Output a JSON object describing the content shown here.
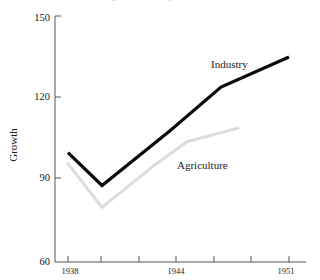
{
  "figure": {
    "clipped_title": "Growth of industrial and agricultural output, 1938-1951",
    "ylabel": "Growth"
  },
  "axes": {
    "y_ticks": [
      {
        "value": 150,
        "label": "150"
      },
      {
        "value": 120,
        "label": "120"
      },
      {
        "value": 90,
        "label": "90"
      },
      {
        "value": 60,
        "label": "60"
      }
    ],
    "x_ticks": [
      {
        "value": 1938,
        "label": "1938"
      },
      {
        "value": 1944,
        "label": "1944"
      },
      {
        "value": 1951,
        "label": "1951"
      }
    ]
  },
  "annotations": {
    "industry": "Industry",
    "agriculture": "Agriculture"
  },
  "colors": {
    "industry": "#0a0a0a",
    "agriculture": "#dcdcdc",
    "axis": "#555555",
    "text": "#1a1a1a"
  },
  "chart_data": {
    "type": "line",
    "title": "Growth of industrial and agricultural output, 1938-1951",
    "xlabel": "",
    "ylabel": "Growth",
    "xlim": [
      1937,
      1952
    ],
    "ylim": [
      60,
      150
    ],
    "grid": false,
    "legend": "inline-annotations",
    "x": [
      1938,
      1940,
      1942,
      1944,
      1946,
      1948,
      1951
    ],
    "series": [
      {
        "name": "Industry",
        "color": "#0a0a0a",
        "x": [
          1938,
          1940,
          1944,
          1947,
          1951
        ],
        "values": [
          100,
          88,
          108,
          124,
          135
        ]
      },
      {
        "name": "Agriculture",
        "color": "#dcdcdc",
        "x": [
          1938,
          1940,
          1943,
          1945,
          1948
        ],
        "values": [
          96,
          80,
          95,
          104,
          109
        ]
      }
    ]
  }
}
